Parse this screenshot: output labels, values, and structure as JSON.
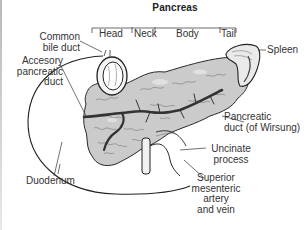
{
  "diagram": {
    "title": "Pancreas",
    "regions": [
      {
        "label": "Head"
      },
      {
        "label": "Neck"
      },
      {
        "label": "Body"
      },
      {
        "label": "Tail"
      }
    ],
    "labels": {
      "common_bile_duct": [
        "Common",
        "bile duct"
      ],
      "accessory_pancreatic_duct": [
        "Accesory",
        "pancreatic",
        "duct"
      ],
      "duodenum": "Duodenum",
      "spleen": "Spleen",
      "pancreatic_duct": [
        "Pancreatic",
        "duct (of Wirsung)"
      ],
      "uncinate_process": [
        "Uncinate",
        "process"
      ],
      "superior_mesenteric": [
        "Superior",
        "mesenteric",
        "artery",
        "and vein"
      ]
    },
    "colors": {
      "tissue": "#c9c9c9",
      "tissue_dark": "#8e8e8e",
      "duct": "#3a3a3a",
      "line": "#2a2a2a",
      "background": "#ffffff"
    }
  }
}
